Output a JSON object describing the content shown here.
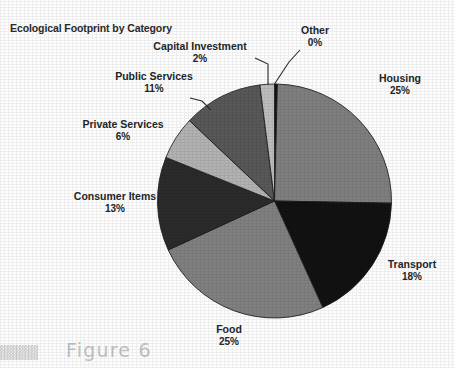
{
  "chart_data": {
    "type": "pie",
    "title": "Ecological Footprint by Category",
    "xlabel": "",
    "ylabel": "",
    "legend": "none (direct labels with leader lines)",
    "grid": false,
    "start_angle_deg": 0,
    "direction": "clockwise",
    "categories": [
      "Other",
      "Housing",
      "Transport",
      "Food",
      "Consumer Items",
      "Private Services",
      "Public Services",
      "Capital Investment"
    ],
    "values": [
      0,
      25,
      18,
      25,
      13,
      6,
      11,
      2
    ],
    "value_unit": "percent",
    "slices": [
      {
        "label": "Other",
        "percent_text": "0%",
        "value": 0.4,
        "color": "#141414",
        "label_align": "center"
      },
      {
        "label": "Housing",
        "percent_text": "25%",
        "value": 25,
        "color": "#7f7f7f",
        "label_align": "center"
      },
      {
        "label": "Transport",
        "percent_text": "18%",
        "value": 18,
        "color": "#121212",
        "label_align": "center"
      },
      {
        "label": "Food",
        "percent_text": "25%",
        "value": 25,
        "color": "#808080",
        "label_align": "center"
      },
      {
        "label": "Consumer Items",
        "percent_text": "13%",
        "value": 13,
        "color": "#2b2b2b",
        "label_align": "center"
      },
      {
        "label": "Private Services",
        "percent_text": "6%",
        "value": 6,
        "color": "#b2b2b2",
        "label_align": "center"
      },
      {
        "label": "Public Services",
        "percent_text": "11%",
        "value": 11,
        "color": "#585858",
        "label_align": "center"
      },
      {
        "label": "Capital Investment",
        "percent_text": "2%",
        "value": 2,
        "color": "#bdbdbd",
        "label_align": "center"
      }
    ]
  },
  "labels": {
    "other": {
      "name": "Other",
      "pct": "0%"
    },
    "capital_investment": {
      "name": "Capital Investment",
      "pct": "2%"
    },
    "public_services": {
      "name": "Public Services",
      "pct": "11%"
    },
    "private_services": {
      "name": "Private Services",
      "pct": "6%"
    },
    "consumer_items": {
      "name": "Consumer Items",
      "pct": "13%"
    },
    "food": {
      "name": "Food",
      "pct": "25%"
    },
    "housing": {
      "name": "Housing",
      "pct": "25%"
    },
    "transport": {
      "name": "Transport",
      "pct": "18%"
    }
  },
  "caption": {
    "text": "Figure 6"
  },
  "colors": {
    "page_background": "#ffffff",
    "text": "#23262b",
    "caption_text": "#c2c4c6",
    "caption_marker": "#cfd1d3",
    "leader_line": "#2a2a2a"
  }
}
